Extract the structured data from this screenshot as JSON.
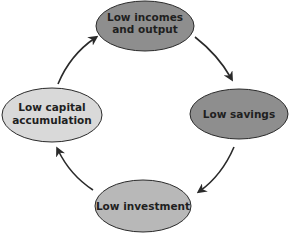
{
  "diagram": {
    "type": "cycle",
    "nodes": [
      {
        "id": "incomes",
        "lines": [
          "Low incomes",
          "and output"
        ],
        "fill": "#8e8e8e"
      },
      {
        "id": "savings",
        "lines": [
          "Low savings"
        ],
        "fill": "#8e8e8e"
      },
      {
        "id": "investment",
        "lines": [
          "Low investment"
        ],
        "fill": "#b8b8b8"
      },
      {
        "id": "capital",
        "lines": [
          "Low capital",
          "accumulation"
        ],
        "fill": "#d9d9d9"
      }
    ],
    "edges": [
      {
        "from": "incomes",
        "to": "savings"
      },
      {
        "from": "savings",
        "to": "investment"
      },
      {
        "from": "investment",
        "to": "capital"
      },
      {
        "from": "capital",
        "to": "incomes"
      }
    ],
    "colors": {
      "stroke": "#1a1a1a",
      "arrow": "#2a2a2a",
      "text": "#1f1f1f"
    }
  }
}
